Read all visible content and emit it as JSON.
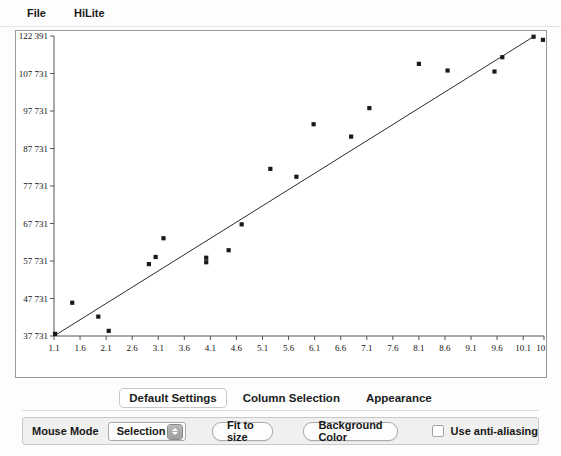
{
  "menu": {
    "items": [
      {
        "name": "file",
        "label": "File"
      },
      {
        "name": "hilite",
        "label": "HiLite"
      }
    ]
  },
  "tabs": [
    {
      "name": "default-settings",
      "label": "Default Settings",
      "active": true
    },
    {
      "name": "column-selection",
      "label": "Column Selection",
      "active": false
    },
    {
      "name": "appearance",
      "label": "Appearance",
      "active": false
    }
  ],
  "controls": {
    "mouse_mode_label": "Mouse Mode",
    "mouse_mode_value": "Selection",
    "fit_to_size_label": "Fit to size",
    "background_color_label": "Background Color",
    "anti_aliasing_label": "Use anti-aliasing",
    "anti_aliasing_checked": false
  },
  "colors": {
    "point": "#1a1a1a",
    "regression_line": "#2b2b2b",
    "axis": "#555555",
    "panel_background": "#ffffff",
    "window_background": "#fdfdfd"
  },
  "chart_data": {
    "type": "scatter",
    "title": "",
    "xlabel": "",
    "ylabel": "",
    "grid": false,
    "legend": false,
    "xlim": [
      1.1,
      10.5
    ],
    "ylim": [
      37731,
      122391
    ],
    "xticks": [
      1.1,
      1.6,
      2.1,
      2.6,
      3.1,
      3.6,
      4.1,
      4.6,
      5.1,
      5.6,
      6.1,
      6.6,
      7.1,
      7.6,
      8.1,
      8.6,
      9.1,
      9.6,
      10.1,
      10.5
    ],
    "xticklabels": [
      "1.1",
      "1.6",
      "2.1",
      "2.6",
      "3.1",
      "3.6",
      "4.1",
      "4.6",
      "5.1",
      "5.6",
      "6.1",
      "6.6",
      "7.1",
      "7.6",
      "8.1",
      "8.6",
      "9.1",
      "9.6",
      "10.1",
      "10.5"
    ],
    "yticks": [
      37731,
      47731,
      57731,
      67731,
      77731,
      87731,
      97731,
      107731,
      122391
    ],
    "yticklabels": [
      "37 731",
      "47 731",
      "57 731",
      "67 731",
      "77 731",
      "87 731",
      "97 731",
      "107 731",
      "122 391"
    ],
    "points": [
      {
        "x": 1.12,
        "y": 38300
      },
      {
        "x": 1.45,
        "y": 46600
      },
      {
        "x": 1.95,
        "y": 42900
      },
      {
        "x": 2.15,
        "y": 39100
      },
      {
        "x": 2.92,
        "y": 56900
      },
      {
        "x": 3.05,
        "y": 58800
      },
      {
        "x": 3.2,
        "y": 63800
      },
      {
        "x": 4.02,
        "y": 57400
      },
      {
        "x": 4.02,
        "y": 58600
      },
      {
        "x": 4.45,
        "y": 60600
      },
      {
        "x": 4.7,
        "y": 67500
      },
      {
        "x": 5.25,
        "y": 82300
      },
      {
        "x": 5.75,
        "y": 80200
      },
      {
        "x": 6.08,
        "y": 94200
      },
      {
        "x": 6.8,
        "y": 90900
      },
      {
        "x": 7.15,
        "y": 98500
      },
      {
        "x": 8.1,
        "y": 111500
      },
      {
        "x": 8.65,
        "y": 108900
      },
      {
        "x": 9.55,
        "y": 108500
      },
      {
        "x": 9.7,
        "y": 114100
      },
      {
        "x": 10.3,
        "y": 122100
      },
      {
        "x": 10.48,
        "y": 120900
      }
    ],
    "regression_line": {
      "name": "regression-line",
      "x": [
        1.1,
        10.32
      ],
      "y": [
        37731,
        122391
      ]
    }
  }
}
